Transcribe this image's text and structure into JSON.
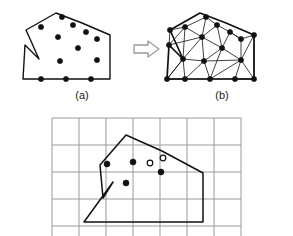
{
  "figure": {
    "background_color": "#ffffff",
    "ink_color": "#111111",
    "grid_color": "#9a9a9a",
    "arrow_color": "#8c8c8c",
    "panels": [
      {
        "id": "panel-a",
        "label": "(a)",
        "caption_position": {
          "x": 82,
          "y": 96
        },
        "description": "Input polygon with boundary nodes and scattered interior points",
        "polygon_outline": [
          [
            23,
            79
          ],
          [
            25,
            45
          ],
          [
            39,
            59
          ],
          [
            26,
            30
          ],
          [
            56,
            13
          ],
          [
            82,
            23
          ],
          [
            110,
            35
          ],
          [
            110,
            79
          ]
        ],
        "boundary_points": [
          [
            41,
            27
          ],
          [
            62,
            17
          ],
          [
            73,
            25
          ],
          [
            86,
            32
          ],
          [
            97,
            39
          ],
          [
            41,
            79
          ],
          [
            66,
            79
          ],
          [
            91,
            79
          ]
        ],
        "interior_points": [
          [
            58,
            37
          ],
          [
            78,
            48
          ],
          [
            97,
            60
          ],
          [
            60,
            61
          ]
        ]
      },
      {
        "id": "arrow",
        "type": "implies-arrow",
        "from": [
          132,
          49
        ],
        "to": [
          158,
          49
        ]
      },
      {
        "id": "panel-b",
        "label": "(b)",
        "caption_position": {
          "x": 222,
          "y": 96
        },
        "description": "Delaunay triangulation of the same polygon",
        "polygon_outline": [
          [
            167,
            79
          ],
          [
            169,
            45
          ],
          [
            183,
            59
          ],
          [
            170,
            30
          ],
          [
            200,
            13
          ],
          [
            226,
            23
          ],
          [
            254,
            35
          ],
          [
            254,
            79
          ]
        ],
        "vertices": [
          [
            185,
            27
          ],
          [
            206,
            17
          ],
          [
            217,
            25
          ],
          [
            230,
            32
          ],
          [
            241,
            39
          ],
          [
            185,
            79
          ],
          [
            210,
            79
          ],
          [
            235,
            79
          ],
          [
            202,
            37
          ],
          [
            222,
            48
          ],
          [
            241,
            60
          ],
          [
            204,
            61
          ],
          [
            183,
            59
          ],
          [
            169,
            45
          ],
          [
            170,
            30
          ],
          [
            254,
            79
          ],
          [
            254,
            35
          ],
          [
            167,
            79
          ]
        ],
        "triangulation_edges": [
          [
            [
              185,
              27
            ],
            [
              206,
              17
            ]
          ],
          [
            [
              206,
              17
            ],
            [
              217,
              25
            ]
          ],
          [
            [
              217,
              25
            ],
            [
              230,
              32
            ]
          ],
          [
            [
              230,
              32
            ],
            [
              241,
              39
            ]
          ],
          [
            [
              185,
              27
            ],
            [
              170,
              30
            ]
          ],
          [
            [
              170,
              30
            ],
            [
              169,
              45
            ]
          ],
          [
            [
              169,
              45
            ],
            [
              183,
              59
            ]
          ],
          [
            [
              183,
              59
            ],
            [
              167,
              79
            ]
          ],
          [
            [
              167,
              79
            ],
            [
              185,
              79
            ]
          ],
          [
            [
              185,
              79
            ],
            [
              210,
              79
            ]
          ],
          [
            [
              210,
              79
            ],
            [
              235,
              79
            ]
          ],
          [
            [
              235,
              79
            ],
            [
              254,
              79
            ]
          ],
          [
            [
              254,
              79
            ],
            [
              254,
              35
            ]
          ],
          [
            [
              254,
              35
            ],
            [
              241,
              39
            ]
          ],
          [
            [
              185,
              27
            ],
            [
              202,
              37
            ]
          ],
          [
            [
              206,
              17
            ],
            [
              202,
              37
            ]
          ],
          [
            [
              217,
              25
            ],
            [
              202,
              37
            ]
          ],
          [
            [
              217,
              25
            ],
            [
              222,
              48
            ]
          ],
          [
            [
              230,
              32
            ],
            [
              222,
              48
            ]
          ],
          [
            [
              230,
              32
            ],
            [
              241,
              39
            ]
          ],
          [
            [
              241,
              39
            ],
            [
              241,
              60
            ]
          ],
          [
            [
              222,
              48
            ],
            [
              241,
              60
            ]
          ],
          [
            [
              222,
              48
            ],
            [
              202,
              37
            ]
          ],
          [
            [
              202,
              37
            ],
            [
              204,
              61
            ]
          ],
          [
            [
              222,
              48
            ],
            [
              204,
              61
            ]
          ],
          [
            [
              204,
              61
            ],
            [
              241,
              60
            ]
          ],
          [
            [
              183,
              59
            ],
            [
              202,
              37
            ]
          ],
          [
            [
              183,
              59
            ],
            [
              204,
              61
            ]
          ],
          [
            [
              183,
              59
            ],
            [
              185,
              79
            ]
          ],
          [
            [
              185,
              79
            ],
            [
              204,
              61
            ]
          ],
          [
            [
              204,
              61
            ],
            [
              210,
              79
            ]
          ],
          [
            [
              210,
              79
            ],
            [
              241,
              60
            ]
          ],
          [
            [
              241,
              60
            ],
            [
              235,
              79
            ]
          ],
          [
            [
              235,
              79
            ],
            [
              254,
              79
            ]
          ],
          [
            [
              241,
              60
            ],
            [
              254,
              79
            ]
          ],
          [
            [
              167,
              79
            ],
            [
              183,
              59
            ]
          ],
          [
            [
              169,
              45
            ],
            [
              202,
              37
            ]
          ],
          [
            [
              169,
              45
            ],
            [
              185,
              27
            ]
          ],
          [
            [
              185,
              27
            ],
            [
              183,
              59
            ]
          ],
          [
            [
              210,
              79
            ],
            [
              222,
              48
            ]
          ],
          [
            [
              185,
              79
            ],
            [
              167,
              79
            ]
          ],
          [
            [
              241,
              60
            ],
            [
              254,
              35
            ]
          ]
        ]
      },
      {
        "id": "panel-grid",
        "description": "Same polygon overlaid on a regular square grid with filled interior sample points and hollow points",
        "grid": {
          "x_start": 52,
          "y_start": 118,
          "columns": 7,
          "rows": 6,
          "cell_size": 27,
          "line_color": "#9a9a9a",
          "line_width": 1
        },
        "polygon_outline": [
          [
            84,
            222
          ],
          [
            113,
            182
          ],
          [
            103,
            198
          ],
          [
            100,
            165
          ],
          [
            126,
            135
          ],
          [
            162,
            151
          ],
          [
            203,
            173
          ],
          [
            203,
            222
          ]
        ],
        "filled_points": [
          [
            107,
            164
          ],
          [
            133,
            162
          ],
          [
            161,
            172
          ],
          [
            126,
            183
          ]
        ],
        "hollow_points": [
          [
            150,
            163
          ],
          [
            163,
            158
          ]
        ]
      }
    ]
  }
}
